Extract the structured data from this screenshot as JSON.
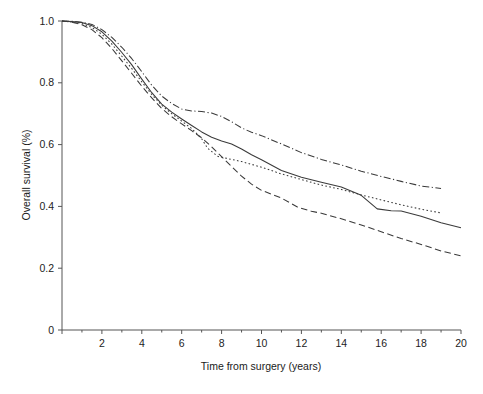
{
  "chart_data": {
    "type": "line",
    "title": "",
    "xlabel": "Time from surgery (years)",
    "ylabel": "Overall survival (%)",
    "xlim": [
      0,
      20
    ],
    "ylim": [
      0,
      1.0
    ],
    "grid": false,
    "legend": "none",
    "x_ticks": [
      0,
      2,
      4,
      6,
      8,
      10,
      12,
      14,
      16,
      18,
      20
    ],
    "x_tick_labels": [
      "",
      "2",
      "4",
      "6",
      "8",
      "10",
      "12",
      "14",
      "16",
      "18",
      "20"
    ],
    "x_minor_ticks": [
      1,
      3,
      5,
      7,
      9,
      11,
      13,
      15,
      17,
      19
    ],
    "y_ticks": [
      0,
      0.2,
      0.4,
      0.6,
      0.8,
      1.0
    ],
    "y_tick_labels": [
      "0",
      "0.2",
      "0.4",
      "0.6",
      "0.8",
      "1.0"
    ],
    "series": [
      {
        "name": "Overall cohort",
        "style": "solid",
        "x": [
          0,
          0.5,
          1.0,
          1.5,
          2.0,
          2.5,
          3.0,
          3.5,
          4.0,
          4.5,
          5.0,
          5.5,
          6.0,
          6.5,
          7.0,
          7.5,
          8.0,
          8.5,
          9.0,
          9.5,
          10.0,
          11.0,
          12.0,
          13.0,
          14.0,
          15.0,
          15.8,
          16.5,
          17.0,
          18.0,
          19.0,
          20.0
        ],
        "y": [
          1.0,
          0.998,
          0.995,
          0.985,
          0.965,
          0.935,
          0.898,
          0.858,
          0.812,
          0.768,
          0.731,
          0.705,
          0.683,
          0.662,
          0.641,
          0.624,
          0.612,
          0.602,
          0.586,
          0.567,
          0.551,
          0.516,
          0.494,
          0.478,
          0.463,
          0.436,
          0.392,
          0.386,
          0.385,
          0.368,
          0.347,
          0.331
        ]
      },
      {
        "name": "Group 1 (highest survival)",
        "style": "dash-dot",
        "x": [
          0,
          0.5,
          1.0,
          1.5,
          2.0,
          2.5,
          3.0,
          3.5,
          4.0,
          4.5,
          5.0,
          5.5,
          6.0,
          6.5,
          7.0,
          7.5,
          8.0,
          8.5,
          9.0,
          9.5,
          10.0,
          11.0,
          12.0,
          13.0,
          14.0,
          15.0,
          16.0,
          17.0,
          18.0,
          19.0
        ],
        "y": [
          1.0,
          0.999,
          0.996,
          0.989,
          0.972,
          0.947,
          0.915,
          0.878,
          0.836,
          0.792,
          0.757,
          0.733,
          0.715,
          0.709,
          0.707,
          0.702,
          0.691,
          0.674,
          0.654,
          0.64,
          0.629,
          0.602,
          0.574,
          0.552,
          0.534,
          0.514,
          0.497,
          0.481,
          0.466,
          0.458
        ]
      },
      {
        "name": "Group 2",
        "style": "dotted",
        "x": [
          0,
          0.5,
          1.0,
          1.5,
          2.0,
          2.5,
          3.0,
          3.5,
          4.0,
          4.5,
          5.0,
          5.5,
          6.0,
          6.5,
          7.0,
          7.3,
          7.8,
          8.5,
          9.0,
          10.0,
          11.0,
          12.0,
          13.0,
          14.0,
          15.0,
          16.0,
          17.0,
          18.0,
          19.0
        ],
        "y": [
          1.0,
          0.997,
          0.992,
          0.979,
          0.957,
          0.925,
          0.886,
          0.846,
          0.803,
          0.762,
          0.727,
          0.7,
          0.676,
          0.652,
          0.619,
          0.588,
          0.562,
          0.552,
          0.545,
          0.527,
          0.505,
          0.487,
          0.469,
          0.455,
          0.437,
          0.421,
          0.405,
          0.391,
          0.379
        ]
      },
      {
        "name": "Group 3 (lowest survival)",
        "style": "dashed",
        "x": [
          0,
          0.5,
          1.0,
          1.5,
          2.0,
          2.5,
          3.0,
          3.5,
          4.0,
          4.5,
          5.0,
          5.5,
          6.0,
          6.5,
          7.0,
          7.5,
          8.0,
          8.5,
          9.0,
          9.5,
          10.0,
          11.0,
          11.8,
          12.5,
          13.0,
          14.0,
          15.0,
          16.0,
          17.0,
          18.0,
          19.0,
          20.0
        ],
        "y": [
          1.0,
          0.996,
          0.988,
          0.972,
          0.946,
          0.911,
          0.871,
          0.83,
          0.789,
          0.751,
          0.717,
          0.69,
          0.667,
          0.645,
          0.622,
          0.593,
          0.561,
          0.529,
          0.498,
          0.472,
          0.452,
          0.427,
          0.398,
          0.384,
          0.378,
          0.36,
          0.34,
          0.318,
          0.296,
          0.277,
          0.256,
          0.24
        ]
      }
    ]
  },
  "axes": {
    "y_title": "Overall survival (%)",
    "x_title": "Time from surgery (years)"
  }
}
